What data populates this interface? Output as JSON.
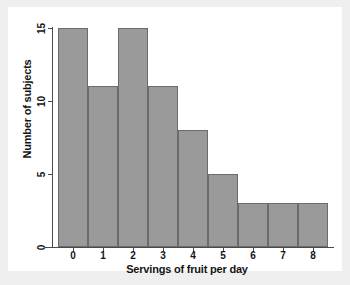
{
  "chart_data": {
    "type": "bar",
    "title": "",
    "subtitle": "",
    "categories": [
      "0",
      "1",
      "2",
      "3",
      "4",
      "5",
      "6",
      "7",
      "8"
    ],
    "values": [
      15,
      11,
      15,
      11,
      8,
      5,
      3,
      3,
      3
    ],
    "xlabel": "Servings of fruit per day",
    "ylabel": "Number of subjects",
    "xlim": [
      -0.5,
      8.5
    ],
    "ylim": [
      0,
      15
    ],
    "ytick_labels": [
      "0",
      "5",
      "10",
      "15"
    ],
    "ytick_values": [
      0,
      5,
      10,
      15
    ],
    "xtick_labels": [
      "0",
      "1",
      "2",
      "3",
      "4",
      "5",
      "6",
      "7",
      "8"
    ],
    "grid": false,
    "legend": null,
    "annotations": [],
    "colors": {
      "bar_fill": "#9a9a9a",
      "bar_edge": "#6b6b6b",
      "axis": "#4a4a4a",
      "text": "#141414",
      "panel_background": "#ffffff",
      "figure_background": "#efefef"
    }
  }
}
